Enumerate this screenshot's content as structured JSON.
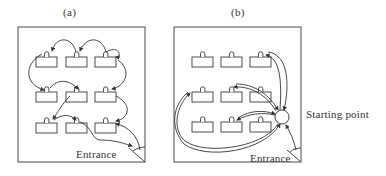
{
  "figure": {
    "panels": [
      {
        "id": "a",
        "label": "(a)",
        "entrance_label": "Entrance",
        "frame": {
          "x": 18,
          "y": 27,
          "w": 127,
          "h": 135
        },
        "boxes": [
          {
            "x": 36,
            "y": 57
          },
          {
            "x": 66,
            "y": 57
          },
          {
            "x": 95,
            "y": 57
          },
          {
            "x": 36,
            "y": 92
          },
          {
            "x": 66,
            "y": 92
          },
          {
            "x": 95,
            "y": 92
          },
          {
            "x": 36,
            "y": 123
          },
          {
            "x": 66,
            "y": 123
          },
          {
            "x": 95,
            "y": 123
          }
        ],
        "route_description": "Serpentine path visiting each display box in sequence from entrance"
      },
      {
        "id": "b",
        "label": "(b)",
        "entrance_label": "Entrance",
        "start_label": "Starting point",
        "frame": {
          "x": 174,
          "y": 27,
          "w": 127,
          "h": 135
        },
        "start_point": {
          "cx": 282,
          "cy": 117,
          "r": 7
        },
        "boxes": [
          {
            "x": 192,
            "y": 57
          },
          {
            "x": 221,
            "y": 57
          },
          {
            "x": 250,
            "y": 57
          },
          {
            "x": 192,
            "y": 92
          },
          {
            "x": 221,
            "y": 92
          },
          {
            "x": 250,
            "y": 92
          },
          {
            "x": 192,
            "y": 122
          },
          {
            "x": 221,
            "y": 122
          },
          {
            "x": 250,
            "y": 122
          }
        ],
        "route_description": "Radial round trips from a central starting point to selected boxes"
      }
    ],
    "box_size": {
      "w": 21,
      "h": 10
    },
    "colors": {
      "line": "#333333",
      "background": "#ffffff"
    }
  }
}
